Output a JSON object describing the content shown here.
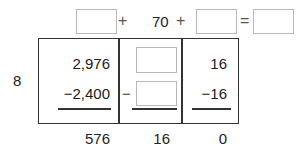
{
  "equation": {
    "term1": "",
    "plus1": "+",
    "term2": "70",
    "plus2": "+",
    "term3": "",
    "equals": "=",
    "result": ""
  },
  "divisor": "8",
  "columns": [
    {
      "top": "2,976",
      "subtract": "−2,400",
      "remainder": "576"
    },
    {
      "top": "",
      "minus": "−",
      "subtract": "",
      "remainder": "16"
    },
    {
      "top": "16",
      "subtract": "−16",
      "remainder": "0"
    }
  ]
}
